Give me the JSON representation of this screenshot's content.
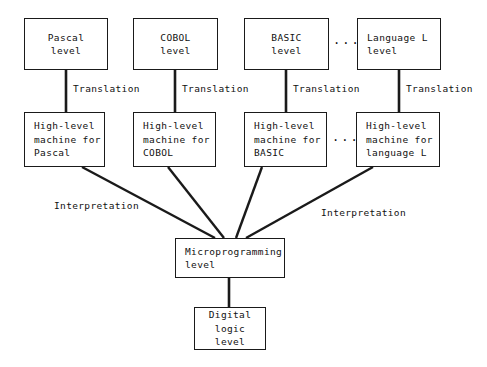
{
  "diagram": {
    "title_text": "",
    "stroke_color": "#1a1a1a",
    "text_color": "#111111",
    "background_color": "#ffffff",
    "ellipsis_glyph": "···",
    "language_level_boxes": [
      {
        "line1": "Pascal",
        "line2": "level"
      },
      {
        "line1": "COBOL",
        "line2": "level"
      },
      {
        "line1": "BASIC",
        "line2": "level"
      },
      {
        "line1": "Language L",
        "line2": "level"
      }
    ],
    "machine_level_boxes": [
      {
        "line1": "High-level",
        "line2": "machine for",
        "line3": "Pascal"
      },
      {
        "line1": "High-level",
        "line2": "machine for",
        "line3": "COBOL"
      },
      {
        "line1": "High-level",
        "line2": "machine for",
        "line3": "BASIC"
      },
      {
        "line1": "High-level",
        "line2": "machine for",
        "line3": "language L"
      }
    ],
    "microprogramming_box": {
      "line1": "Microprogramming",
      "line2": "level"
    },
    "digital_logic_box": {
      "line1": "Digital",
      "line2": "logic",
      "line3": "level"
    },
    "translation_labels": [
      "Translation",
      "Translation",
      "Translation",
      "Translation"
    ],
    "interpretation_labels": [
      "Interpretation",
      "Interpretation"
    ]
  }
}
